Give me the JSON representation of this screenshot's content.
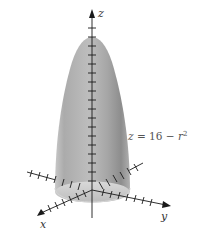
{
  "figure": {
    "type": "3d-surface-diagram",
    "surface": "paraboloid",
    "equation": {
      "lhs": "z",
      "equals": "=",
      "constant": "16",
      "minus": "−",
      "var": "r",
      "exp": "2",
      "full": "z = 16 − r²"
    },
    "axes": {
      "x_label": "x",
      "y_label": "y",
      "z_label": "z"
    },
    "colors": {
      "surface_light": "#e8e8e8",
      "surface_mid": "#b4b4b4",
      "surface_dark": "#8a8a8a",
      "axis": "#1a1a1a",
      "background": "#ffffff"
    }
  }
}
